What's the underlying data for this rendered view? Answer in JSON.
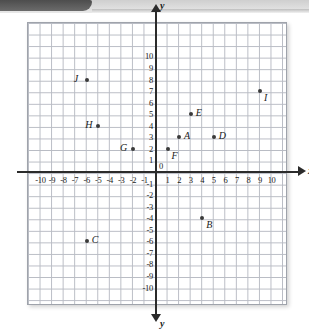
{
  "banner": {
    "tab_label": ""
  },
  "chart_data": {
    "type": "scatter",
    "title": "",
    "xlabel": "x",
    "ylabel": "y",
    "xlim": [
      -11,
      11
    ],
    "ylim": [
      -11,
      11
    ],
    "grid": true,
    "origin_label": "0",
    "x_ticks": [
      -10,
      -9,
      -8,
      -7,
      -6,
      -5,
      -4,
      -3,
      -2,
      -1,
      1,
      2,
      3,
      4,
      5,
      6,
      7,
      8,
      9,
      10
    ],
    "y_ticks": [
      10,
      9,
      8,
      7,
      6,
      5,
      4,
      3,
      2,
      1,
      -1,
      -2,
      -3,
      -4,
      -5,
      -6,
      -7,
      -8,
      -9,
      -10
    ],
    "x_tick_labels": [
      "-10",
      "-9",
      "-8",
      "-7",
      "-6",
      "-5",
      "-4",
      "-3",
      "-2",
      "-1",
      "1",
      "2",
      "3",
      "4",
      "5",
      "6",
      "7",
      "8",
      "9",
      "10"
    ],
    "y_tick_labels": [
      "10",
      "9",
      "8",
      "7",
      "6",
      "5",
      "4",
      "3",
      "2",
      "1",
      "-1",
      "-2",
      "-3",
      "-4",
      "-5",
      "-6",
      "-7",
      "-8",
      "-9",
      "-10"
    ],
    "points": [
      {
        "label": "A",
        "x": 2,
        "y": 3,
        "label_pos": "right"
      },
      {
        "label": "B",
        "x": 4,
        "y": -4,
        "label_pos": "below-right"
      },
      {
        "label": "C",
        "x": -6,
        "y": -6,
        "label_pos": "right"
      },
      {
        "label": "D",
        "x": 5,
        "y": 3,
        "label_pos": "right"
      },
      {
        "label": "E",
        "x": 3,
        "y": 5,
        "label_pos": "right"
      },
      {
        "label": "F",
        "x": 1,
        "y": 2,
        "label_pos": "below-right"
      },
      {
        "label": "G",
        "x": -2,
        "y": 2,
        "label_pos": "left"
      },
      {
        "label": "H",
        "x": -5,
        "y": 4,
        "label_pos": "left"
      },
      {
        "label": "I",
        "x": 9,
        "y": 7,
        "label_pos": "below-right"
      },
      {
        "label": "J",
        "x": -6,
        "y": 8,
        "label_pos": "left"
      }
    ]
  }
}
